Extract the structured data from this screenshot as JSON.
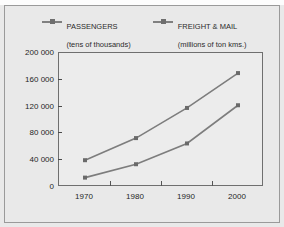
{
  "chart_data": {
    "type": "line",
    "title": "",
    "xlabel": "",
    "ylabel": "",
    "categories": [
      "1970",
      "1980",
      "1990",
      "2000"
    ],
    "x": [
      1970,
      1980,
      1990,
      2000
    ],
    "ylim": [
      0,
      200000
    ],
    "yticks": [
      0,
      40000,
      80000,
      120000,
      160000,
      200000
    ],
    "ytick_labels": [
      "0",
      "40 000",
      "80 000",
      "120 000",
      "160 000",
      "200 000"
    ],
    "grid": false,
    "legend_position": "top",
    "series": [
      {
        "name": "PASSENGERS",
        "sublabel": "(tens of thousands)",
        "color": "#7d7d7d",
        "marker": "square",
        "values": [
          40000,
          73000,
          118000,
          170000
        ]
      },
      {
        "name": "FREIGHT & MAIL",
        "sublabel": "(millions of ton kms.)",
        "color": "#7d7d7d",
        "marker": "square",
        "values": [
          14000,
          34000,
          65000,
          122000
        ]
      }
    ]
  },
  "legend": {
    "entries": [
      {
        "label": "PASSENGERS",
        "sublabel": "(tens of thousands)"
      },
      {
        "label": "FREIGHT & MAIL",
        "sublabel": "(millions of ton kms.)"
      }
    ]
  },
  "colors": {
    "line": "#7d7d7d",
    "marker": "#6a6a6a",
    "axis": "#6f6f6f",
    "background": "#e9e9e9",
    "plot_background": "#ececec",
    "text": "#1f1f1f",
    "frame": "#9a9a9a"
  }
}
